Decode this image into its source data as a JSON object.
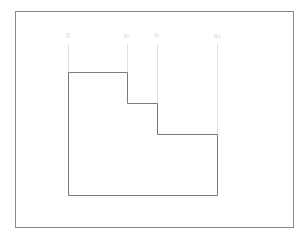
{
  "diagram": {
    "type": "staircase-profile",
    "frame": {
      "x": 15,
      "y": 11,
      "width": 278,
      "height": 216,
      "stroke": "#8a8a8a"
    },
    "shape": {
      "stroke": "#7a7a7a",
      "points": [
        [
          68,
          72
        ],
        [
          127,
          72
        ],
        [
          127,
          103
        ],
        [
          157,
          103
        ],
        [
          157,
          134
        ],
        [
          217,
          134
        ],
        [
          217,
          195
        ],
        [
          68,
          195
        ]
      ]
    },
    "markers": [
      {
        "label": "0",
        "x": 68,
        "line_bottom": 72
      },
      {
        "label": "a₁",
        "x": 127,
        "line_bottom": 72
      },
      {
        "label": "h",
        "x": 157,
        "line_bottom": 103
      },
      {
        "label": "a₂",
        "x": 217,
        "line_bottom": 134
      }
    ],
    "marker_line_color": "#e0e0e0",
    "marker_top": 44
  }
}
